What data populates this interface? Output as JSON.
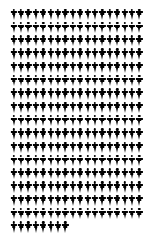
{
  "chart_data": {
    "type": "pictogram",
    "title": "",
    "subtitle": "",
    "xlabel": "",
    "ylabel": "",
    "legend": [],
    "annotations": [],
    "grid": false,
    "unit_symbol": "person-figure",
    "unit_value": 1,
    "glyph_color": "#000000",
    "background_color": "#ffffff",
    "columns_per_row": 18,
    "full_rows": 16,
    "last_row_count": 8,
    "total_units": 296,
    "categories": [
      "units"
    ],
    "values": [
      296
    ],
    "rows": [
      18,
      18,
      18,
      18,
      18,
      18,
      18,
      18,
      18,
      18,
      18,
      18,
      18,
      18,
      18,
      18,
      8
    ]
  },
  "figure": {
    "kind": "unit-chart",
    "width_px": 153,
    "height_px": 236
  }
}
